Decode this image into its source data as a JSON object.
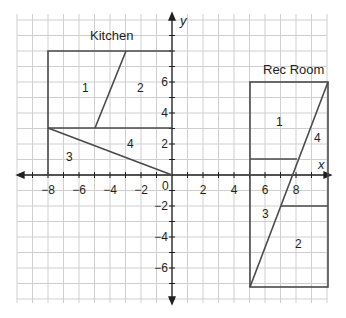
{
  "diagram": {
    "axes": {
      "x_label": "x",
      "y_label": "y",
      "origin_label": "0",
      "x_ticks": [
        "−8",
        "−6",
        "−4",
        "−2",
        "2",
        "4",
        "6",
        "8"
      ],
      "y_ticks": [
        "6",
        "4",
        "2",
        "−2",
        "−4",
        "−6"
      ],
      "x_range": [
        -10,
        10
      ],
      "y_range": [
        -8,
        10
      ]
    },
    "kitchen": {
      "title": "Kitchen",
      "rect": {
        "x1": -8,
        "y1": 0,
        "x2": 0,
        "y2": 8
      },
      "regions": [
        "1",
        "2",
        "3",
        "4"
      ]
    },
    "rec_room": {
      "title": "Rec Room",
      "rect": {
        "x1": 5,
        "y1": -7,
        "x2": 10,
        "y2": 6
      },
      "regions": [
        "1",
        "2",
        "3",
        "4"
      ]
    },
    "colors": {
      "grid": "#c8c8c8",
      "lines": "#4a4a4a",
      "axis": "#231f20"
    }
  }
}
